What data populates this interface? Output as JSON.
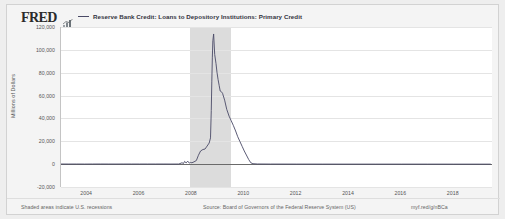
{
  "header": {
    "logo_text": "FRED",
    "logo_icon": "fred-bar-chart-icon",
    "legend_label": "Reserve Bank Credit: Loans to Depository Institutions: Primary Credit",
    "legend_color": "#4a4a66"
  },
  "footer": {
    "recession_note": "Shaded areas indicate U.S. recessions",
    "source": "Source: Board of Governors of the Federal Reserve System (US)",
    "url": "myf.red/g/nBCa"
  },
  "chart_data": {
    "type": "line",
    "title": "Reserve Bank Credit: Loans to Depository Institutions: Primary Credit",
    "xlabel": "",
    "ylabel": "Millions of Dollars",
    "ylim": [
      -20000,
      120000
    ],
    "xlim": [
      2003.0,
      2019.5
    ],
    "yticks": [
      120000,
      100000,
      80000,
      60000,
      40000,
      20000,
      0,
      -20000
    ],
    "ytick_labels": [
      "120,000",
      "100,000",
      "80,000",
      "60,000",
      "40,000",
      "20,000",
      "0",
      "-20,000"
    ],
    "xticks": [
      2004,
      2006,
      2008,
      2010,
      2012,
      2014,
      2016,
      2018
    ],
    "xtick_labels": [
      "2004",
      "2006",
      "2008",
      "2010",
      "2012",
      "2014",
      "2016",
      "2018"
    ],
    "grid": true,
    "legend_position": "top",
    "line_color": "#4a4a66",
    "recession_color": "#dcdcdc",
    "recessions": [
      {
        "start": 2007.92,
        "end": 2009.5,
        "label": "2007-2009 recession"
      }
    ],
    "series": [
      {
        "name": "Reserve Bank Credit: Loans to Depository Institutions: Primary Credit",
        "x": [
          2003.0,
          2003.3,
          2003.6,
          2003.9,
          2004.2,
          2004.5,
          2004.8,
          2005.1,
          2005.4,
          2005.7,
          2006.0,
          2006.3,
          2006.6,
          2006.9,
          2007.2,
          2007.5,
          2007.62,
          2007.68,
          2007.72,
          2007.78,
          2007.84,
          2007.9,
          2007.95,
          2008.0,
          2008.08,
          2008.17,
          2008.25,
          2008.33,
          2008.42,
          2008.5,
          2008.58,
          2008.66,
          2008.71,
          2008.74,
          2008.76,
          2008.78,
          2008.8,
          2008.83,
          2008.87,
          2008.92,
          2008.96,
          2009.0,
          2009.04,
          2009.08,
          2009.12,
          2009.17,
          2009.25,
          2009.33,
          2009.42,
          2009.5,
          2009.58,
          2009.67,
          2009.75,
          2009.83,
          2009.92,
          2010.0,
          2010.08,
          2010.17,
          2010.25,
          2010.33,
          2010.5,
          2011.0,
          2012.0,
          2013.0,
          2014.0,
          2015.0,
          2016.0,
          2017.0,
          2018.0,
          2019.0,
          2019.4
        ],
        "values": [
          120,
          90,
          110,
          85,
          95,
          130,
          100,
          90,
          120,
          110,
          95,
          105,
          100,
          120,
          90,
          110,
          1200,
          600,
          2400,
          1100,
          2600,
          900,
          1500,
          1200,
          2000,
          3200,
          7800,
          11500,
          12800,
          13200,
          15800,
          18500,
          23000,
          47000,
          72000,
          93000,
          108000,
          113900,
          96000,
          88000,
          80000,
          74000,
          69000,
          64000,
          63500,
          62000,
          56000,
          48000,
          42000,
          38000,
          34000,
          29000,
          24000,
          20000,
          15500,
          11500,
          8000,
          4000,
          1200,
          400,
          150,
          80,
          50,
          40,
          30,
          25,
          20,
          18,
          15,
          12,
          10
        ],
        "units": "Millions of Dollars",
        "peak_value": 113900,
        "peak_date": "2008-10",
        "color": "#4a4a66"
      }
    ]
  }
}
